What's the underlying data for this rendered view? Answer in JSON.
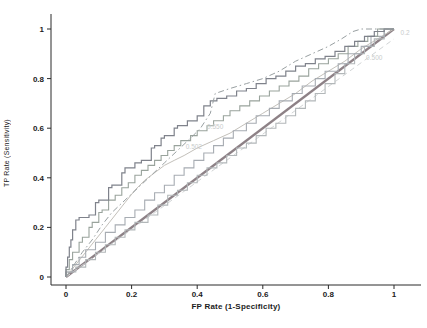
{
  "page": {
    "background": "#ffffff",
    "tick_color": "#1b1b1b",
    "axis_color": "#2a2a2a",
    "annotation_color": "#c9cccc"
  },
  "chart_data": {
    "type": "line",
    "title": "",
    "xlabel": "FP Rate (1-Specificity)",
    "ylabel": "TP Rate (Sensitivity)",
    "xlim": [
      0,
      1
    ],
    "ylim": [
      0,
      1
    ],
    "grid": false,
    "legend": "none",
    "xticks": [
      0,
      0.2,
      0.4,
      0.6,
      0.8,
      1
    ],
    "yticks": [
      0,
      0.2,
      0.4,
      0.6,
      0.8,
      1
    ],
    "xtick_labels": [
      "0",
      "0.2",
      "0.4",
      "0.6",
      "0.8",
      "1"
    ],
    "ytick_labels": [
      "0",
      "0.2",
      "0.4",
      "0.6",
      "0.8",
      "1"
    ],
    "annotations": [
      {
        "text": "0.2",
        "fp": 1.02,
        "tp": 0.975
      },
      {
        "text": "0.500",
        "fp": 0.915,
        "tp": 0.875
      },
      {
        "text": "0.550",
        "fp": 0.43,
        "tp": 0.595
      },
      {
        "text": "0.502",
        "fp": 0.365,
        "tp": 0.515
      }
    ],
    "series": [
      {
        "name": "reference-diagonal",
        "color": "#8d8186",
        "width": 2.2,
        "dash": null,
        "step": false,
        "points": [
          [
            0,
            0
          ],
          [
            1,
            1
          ]
        ]
      },
      {
        "name": "reference-dashed-low",
        "color": "#d1d4d5",
        "width": 1,
        "dash": "5,4",
        "step": false,
        "points": [
          [
            0,
            0
          ],
          [
            1,
            0.96
          ]
        ]
      },
      {
        "name": "roc-light-curve",
        "color": "#c3c0ba",
        "width": 1,
        "dash": null,
        "step": false,
        "points": [
          [
            0,
            0
          ],
          [
            0.03,
            0.05
          ],
          [
            0.06,
            0.1
          ],
          [
            0.09,
            0.15
          ],
          [
            0.12,
            0.2
          ],
          [
            0.15,
            0.25
          ],
          [
            0.18,
            0.3
          ],
          [
            0.21,
            0.35
          ],
          [
            0.24,
            0.39
          ],
          [
            0.27,
            0.42
          ],
          [
            0.3,
            0.45
          ],
          [
            0.33,
            0.47
          ],
          [
            0.36,
            0.49
          ],
          [
            0.4,
            0.52
          ],
          [
            0.45,
            0.55
          ],
          [
            0.5,
            0.58
          ],
          [
            0.55,
            0.62
          ],
          [
            0.6,
            0.66
          ],
          [
            0.65,
            0.7
          ],
          [
            0.7,
            0.74
          ],
          [
            0.75,
            0.79
          ],
          [
            0.8,
            0.83
          ],
          [
            0.85,
            0.87
          ],
          [
            0.9,
            0.92
          ],
          [
            0.95,
            0.96
          ],
          [
            1,
            1
          ]
        ]
      },
      {
        "name": "roc-low-stepped",
        "color": "#b2b7b9",
        "width": 1.1,
        "dash": null,
        "step": true,
        "points": [
          [
            0,
            0
          ],
          [
            0.03,
            0.02
          ],
          [
            0.06,
            0.04
          ],
          [
            0.09,
            0.07
          ],
          [
            0.12,
            0.1
          ],
          [
            0.15,
            0.13
          ],
          [
            0.18,
            0.16
          ],
          [
            0.21,
            0.19
          ],
          [
            0.25,
            0.22
          ],
          [
            0.28,
            0.25
          ],
          [
            0.31,
            0.29
          ],
          [
            0.34,
            0.33
          ],
          [
            0.37,
            0.35
          ],
          [
            0.4,
            0.38
          ],
          [
            0.43,
            0.41
          ],
          [
            0.46,
            0.44
          ],
          [
            0.49,
            0.46
          ],
          [
            0.52,
            0.49
          ],
          [
            0.55,
            0.52
          ],
          [
            0.58,
            0.54
          ],
          [
            0.61,
            0.57
          ],
          [
            0.64,
            0.6
          ],
          [
            0.67,
            0.62
          ],
          [
            0.7,
            0.65
          ],
          [
            0.73,
            0.68
          ],
          [
            0.76,
            0.71
          ],
          [
            0.79,
            0.74
          ],
          [
            0.82,
            0.78
          ],
          [
            0.85,
            0.82
          ],
          [
            0.88,
            0.86
          ],
          [
            0.91,
            0.9
          ],
          [
            0.94,
            0.93
          ],
          [
            0.97,
            0.96
          ],
          [
            1,
            1
          ]
        ]
      },
      {
        "name": "roc-mid-stepped",
        "color": "#a7acb2",
        "width": 1.1,
        "dash": null,
        "step": true,
        "points": [
          [
            0,
            0
          ],
          [
            0.02,
            0.02
          ],
          [
            0.04,
            0.05
          ],
          [
            0.06,
            0.08
          ],
          [
            0.09,
            0.11
          ],
          [
            0.12,
            0.14
          ],
          [
            0.15,
            0.18
          ],
          [
            0.18,
            0.21
          ],
          [
            0.21,
            0.24
          ],
          [
            0.24,
            0.27
          ],
          [
            0.27,
            0.31
          ],
          [
            0.3,
            0.34
          ],
          [
            0.33,
            0.37
          ],
          [
            0.36,
            0.41
          ],
          [
            0.39,
            0.44
          ],
          [
            0.42,
            0.47
          ],
          [
            0.45,
            0.5
          ],
          [
            0.48,
            0.53
          ],
          [
            0.51,
            0.56
          ],
          [
            0.55,
            0.59
          ],
          [
            0.58,
            0.62
          ],
          [
            0.62,
            0.65
          ],
          [
            0.65,
            0.68
          ],
          [
            0.69,
            0.71
          ],
          [
            0.72,
            0.74
          ],
          [
            0.76,
            0.77
          ],
          [
            0.79,
            0.8
          ],
          [
            0.83,
            0.83
          ],
          [
            0.86,
            0.86
          ],
          [
            0.9,
            0.9
          ],
          [
            0.93,
            0.93
          ],
          [
            0.97,
            0.97
          ],
          [
            1,
            1
          ]
        ]
      },
      {
        "name": "roc-upper-stepped",
        "color": "#99a39c",
        "width": 1.1,
        "dash": null,
        "step": true,
        "points": [
          [
            0,
            0
          ],
          [
            0.01,
            0.03
          ],
          [
            0.02,
            0.07
          ],
          [
            0.04,
            0.1
          ],
          [
            0.05,
            0.14
          ],
          [
            0.07,
            0.16
          ],
          [
            0.08,
            0.2
          ],
          [
            0.1,
            0.22
          ],
          [
            0.11,
            0.26
          ],
          [
            0.13,
            0.27
          ],
          [
            0.15,
            0.31
          ],
          [
            0.17,
            0.33
          ],
          [
            0.19,
            0.36
          ],
          [
            0.21,
            0.38
          ],
          [
            0.23,
            0.41
          ],
          [
            0.25,
            0.43
          ],
          [
            0.27,
            0.45
          ],
          [
            0.29,
            0.47
          ],
          [
            0.31,
            0.49
          ],
          [
            0.33,
            0.51
          ],
          [
            0.35,
            0.53
          ],
          [
            0.38,
            0.55
          ],
          [
            0.4,
            0.57
          ],
          [
            0.43,
            0.59
          ],
          [
            0.45,
            0.61
          ],
          [
            0.48,
            0.63
          ],
          [
            0.5,
            0.65
          ],
          [
            0.53,
            0.67
          ],
          [
            0.56,
            0.69
          ],
          [
            0.59,
            0.71
          ],
          [
            0.62,
            0.73
          ],
          [
            0.65,
            0.75
          ],
          [
            0.68,
            0.77
          ],
          [
            0.71,
            0.79
          ],
          [
            0.74,
            0.81
          ],
          [
            0.77,
            0.84
          ],
          [
            0.8,
            0.86
          ],
          [
            0.83,
            0.88
          ],
          [
            0.86,
            0.9
          ],
          [
            0.89,
            0.93
          ],
          [
            0.92,
            0.95
          ],
          [
            0.95,
            0.97
          ],
          [
            1,
            1
          ]
        ]
      },
      {
        "name": "roc-dark-steep",
        "color": "#7f828b",
        "width": 1.2,
        "dash": null,
        "step": true,
        "points": [
          [
            0,
            0
          ],
          [
            0.005,
            0.04
          ],
          [
            0.01,
            0.08
          ],
          [
            0.015,
            0.12
          ],
          [
            0.02,
            0.15
          ],
          [
            0.03,
            0.19
          ],
          [
            0.04,
            0.23
          ],
          [
            0.07,
            0.24
          ],
          [
            0.09,
            0.25
          ],
          [
            0.1,
            0.3
          ],
          [
            0.13,
            0.31
          ],
          [
            0.14,
            0.36
          ],
          [
            0.17,
            0.37
          ],
          [
            0.18,
            0.42
          ],
          [
            0.21,
            0.44
          ],
          [
            0.23,
            0.46
          ],
          [
            0.26,
            0.47
          ],
          [
            0.27,
            0.52
          ],
          [
            0.29,
            0.53
          ],
          [
            0.3,
            0.56
          ],
          [
            0.33,
            0.57
          ],
          [
            0.34,
            0.6
          ],
          [
            0.37,
            0.61
          ],
          [
            0.4,
            0.63
          ],
          [
            0.42,
            0.65
          ],
          [
            0.44,
            0.69
          ],
          [
            0.46,
            0.71
          ],
          [
            0.49,
            0.72
          ],
          [
            0.52,
            0.73
          ],
          [
            0.55,
            0.75
          ],
          [
            0.58,
            0.76
          ],
          [
            0.61,
            0.78
          ],
          [
            0.64,
            0.8
          ],
          [
            0.67,
            0.81
          ],
          [
            0.7,
            0.83
          ],
          [
            0.73,
            0.85
          ],
          [
            0.76,
            0.86
          ],
          [
            0.79,
            0.88
          ],
          [
            0.82,
            0.89
          ],
          [
            0.85,
            0.91
          ],
          [
            0.88,
            0.93
          ],
          [
            0.91,
            0.95
          ],
          [
            0.94,
            0.97
          ],
          [
            0.97,
            0.99
          ],
          [
            1,
            1
          ]
        ]
      },
      {
        "name": "roc-dashdot-envelope",
        "color": "#989fa1",
        "width": 1,
        "dash": "6,3,1.5,3",
        "step": false,
        "points": [
          [
            0,
            0
          ],
          [
            0.02,
            0.04
          ],
          [
            0.05,
            0.1
          ],
          [
            0.08,
            0.15
          ],
          [
            0.11,
            0.21
          ],
          [
            0.14,
            0.26
          ],
          [
            0.18,
            0.31
          ],
          [
            0.22,
            0.36
          ],
          [
            0.26,
            0.41
          ],
          [
            0.3,
            0.46
          ],
          [
            0.34,
            0.51
          ],
          [
            0.38,
            0.56
          ],
          [
            0.41,
            0.6
          ],
          [
            0.44,
            0.66
          ],
          [
            0.455,
            0.74
          ],
          [
            0.5,
            0.76
          ],
          [
            0.55,
            0.78
          ],
          [
            0.6,
            0.8
          ],
          [
            0.65,
            0.83
          ],
          [
            0.7,
            0.87
          ],
          [
            0.75,
            0.9
          ],
          [
            0.8,
            0.93
          ],
          [
            0.84,
            0.96
          ],
          [
            0.875,
            0.99
          ],
          [
            0.9,
            1
          ],
          [
            1,
            1
          ]
        ]
      }
    ]
  }
}
